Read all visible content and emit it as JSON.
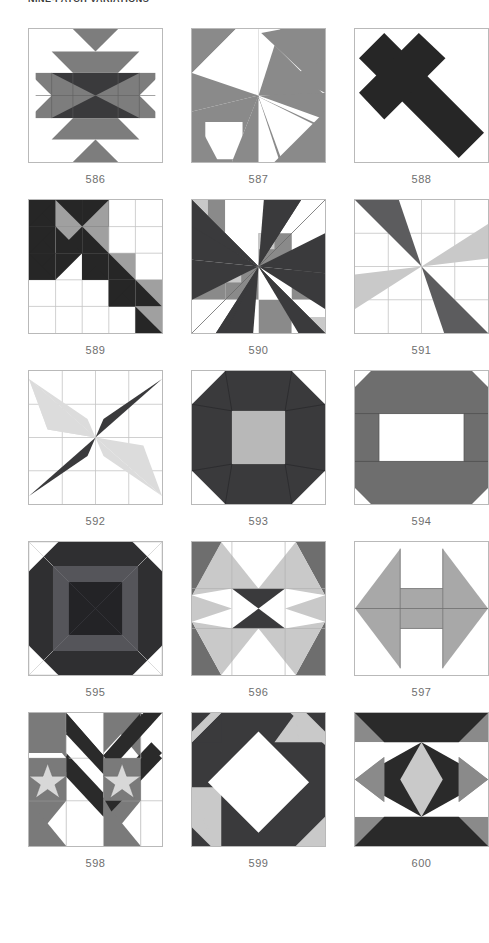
{
  "header": {
    "title": "NINE-PATCH VARIATIONS"
  },
  "palette": {
    "dark": "#3a3a3c",
    "darker": "#2f2f31",
    "black": "#262626",
    "mid": "#7d7d7d",
    "gray": "#8a8a8a",
    "light": "#c9c9c9",
    "lighter": "#d6d6d6",
    "white": "#ffffff",
    "grid_line": "#c4c4c4",
    "border": "#b9b9b9",
    "caption": "#6e6e6e"
  },
  "grid": {
    "columns": 3,
    "rows": 5,
    "block_size": 135
  },
  "blocks": [
    {
      "id": "586",
      "label": "586",
      "name": "block-586",
      "grid": 6,
      "grid_visible": true
    },
    {
      "id": "587",
      "label": "587",
      "name": "block-587",
      "grid": 0,
      "grid_visible": false
    },
    {
      "id": "588",
      "label": "588",
      "name": "block-588",
      "grid": 0,
      "grid_visible": false
    },
    {
      "id": "589",
      "label": "589",
      "name": "block-589",
      "grid": 5,
      "grid_visible": true
    },
    {
      "id": "590",
      "label": "590",
      "name": "block-590",
      "grid": 0,
      "grid_visible": false
    },
    {
      "id": "591",
      "label": "591",
      "name": "block-591",
      "grid": 4,
      "grid_visible": true
    },
    {
      "id": "592",
      "label": "592",
      "name": "block-592",
      "grid": 4,
      "grid_visible": true
    },
    {
      "id": "593",
      "label": "593",
      "name": "block-593",
      "grid": 0,
      "grid_visible": false
    },
    {
      "id": "594",
      "label": "594",
      "name": "block-594",
      "grid": 0,
      "grid_visible": false
    },
    {
      "id": "595",
      "label": "595",
      "name": "block-595",
      "grid": 0,
      "grid_visible": false
    },
    {
      "id": "596",
      "label": "596",
      "name": "block-596",
      "grid": 0,
      "grid_visible": false
    },
    {
      "id": "597",
      "label": "597",
      "name": "block-597",
      "grid": 0,
      "grid_visible": false
    },
    {
      "id": "598",
      "label": "598",
      "name": "block-598",
      "grid": 0,
      "grid_visible": false
    },
    {
      "id": "599",
      "label": "599",
      "name": "block-599",
      "grid": 0,
      "grid_visible": false
    },
    {
      "id": "600",
      "label": "600",
      "name": "block-600",
      "grid": 0,
      "grid_visible": false
    }
  ]
}
